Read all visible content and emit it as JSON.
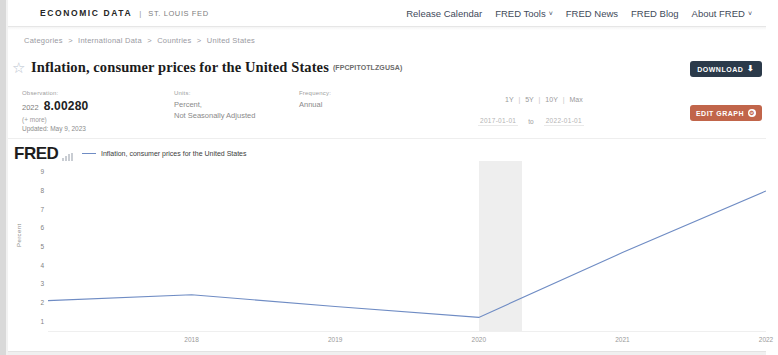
{
  "header": {
    "brand_main": "ECONOMIC DATA",
    "brand_sep": "|",
    "brand_sub": "ST. LOUIS FED",
    "nav": [
      {
        "label": "Release Calendar",
        "has_caret": false
      },
      {
        "label": "FRED Tools",
        "has_caret": true
      },
      {
        "label": "FRED News",
        "has_caret": false
      },
      {
        "label": "FRED Blog",
        "has_caret": false
      },
      {
        "label": "About FRED",
        "has_caret": true
      }
    ],
    "caret_glyph": "˅"
  },
  "breadcrumb": {
    "separator": ">",
    "items": [
      "Categories",
      "International Data",
      "Countries",
      "United States"
    ]
  },
  "title": {
    "star_icon": "☆",
    "text": "Inflation, consumer prices for the United States",
    "series_id": "(FPCPITOTLZGUSA)"
  },
  "meta": {
    "observation": {
      "label": "Observation:",
      "year": "2022",
      "value": "8.00280",
      "more": "(+ more)",
      "updated": "Updated: May 9, 2023"
    },
    "units": {
      "label": "Units:",
      "line1": "Percent,",
      "line2": "Not Seasonally Adjusted"
    },
    "frequency": {
      "label": "Frequency:",
      "line1": "Annual"
    }
  },
  "range": {
    "presets": [
      "1Y",
      "5Y",
      "10Y",
      "Max"
    ],
    "separator": "|",
    "start_date": "2017-01-01",
    "to_label": "to",
    "end_date": "2022-01-01"
  },
  "actions": {
    "download": {
      "label": "DOWNLOAD",
      "icon": "download-icon",
      "glyph": "⬇",
      "color": "#2b3a4a"
    },
    "edit_graph": {
      "label": "EDIT GRAPH",
      "icon": "gear-icon",
      "glyph": "⚙",
      "color": "#c1654a"
    },
    "view_map": {
      "label": "VIEW MAP",
      "icon": "globe-icon",
      "glyph": "●",
      "color": "#56684e"
    }
  },
  "graph": {
    "logo": "FRED",
    "logo_mark": "bar-chart-icon",
    "legend_label": "Inflation, consumer prices for the United States",
    "legend_color": "#6f8cc4"
  },
  "chart_data": {
    "type": "line",
    "title": "Inflation, consumer prices for the United States",
    "xlabel": "",
    "ylabel": "Percent",
    "ylim": [
      0.5,
      9.5
    ],
    "yticks": [
      9,
      8,
      7,
      6,
      5,
      4,
      3,
      2,
      1
    ],
    "xticks": [
      "2018",
      "2019",
      "2020",
      "2021",
      "2022"
    ],
    "xlim": [
      "2017",
      "2022"
    ],
    "grid": false,
    "legend_position": "top",
    "recession_bands": [
      {
        "start": "2020",
        "end": "2020.3",
        "color": "#ebebeb"
      }
    ],
    "series": [
      {
        "name": "Inflation, consumer prices for the United States",
        "color": "#6f8cc4",
        "x": [
          "2017",
          "2018",
          "2019",
          "2020",
          "2021",
          "2022"
        ],
        "values": [
          2.13,
          2.44,
          1.81,
          1.23,
          4.7,
          8.0
        ]
      }
    ]
  }
}
